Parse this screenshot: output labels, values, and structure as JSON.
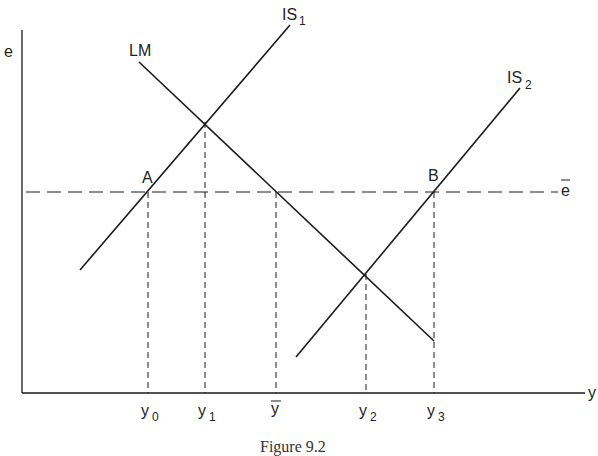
{
  "figure": {
    "caption": "Figure 9.2",
    "axes": {
      "y_label": "e",
      "x_label": "y"
    },
    "curves": [
      {
        "id": "IS1",
        "label": "IS",
        "subscript": "1"
      },
      {
        "id": "LM",
        "label": "LM",
        "subscript": ""
      },
      {
        "id": "IS2",
        "label": "IS",
        "subscript": "2"
      }
    ],
    "reference_line": {
      "label": "e",
      "overbar": true,
      "style": "dashed"
    },
    "points": [
      {
        "label": "A"
      },
      {
        "label": "B"
      }
    ],
    "x_ticks": [
      {
        "label": "y",
        "subscript": "0"
      },
      {
        "label": "y",
        "subscript": "1"
      },
      {
        "label": "y",
        "subscript": "",
        "overbar": true
      },
      {
        "label": "y",
        "subscript": "2"
      },
      {
        "label": "y",
        "subscript": "3"
      }
    ]
  },
  "colors": {
    "line": "#1a1a1a",
    "background": "#ffffff"
  }
}
